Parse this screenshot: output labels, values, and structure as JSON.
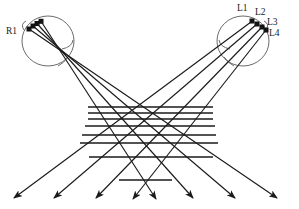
{
  "figure": {
    "type": "ray-diagram",
    "caption_labels": {
      "left_source": "R1",
      "right_sources": [
        "L1",
        "L2",
        "L3",
        "L4"
      ]
    },
    "colors": {
      "ray_stroke": "#1a1a1a",
      "head_outline": "#555555",
      "grid_line": "#1a1a1a",
      "background": "#ffffff",
      "marker_fill": "#111111"
    },
    "labels": [
      {
        "id": "R1",
        "text": "R1",
        "x": 6,
        "y": 28
      },
      {
        "id": "L1",
        "text": "L1",
        "x": 238,
        "y": 6
      },
      {
        "id": "L2",
        "text": "L2",
        "x": 256,
        "y": 9
      },
      {
        "id": "L3",
        "text": "L3",
        "x": 268,
        "y": 18
      },
      {
        "id": "L4",
        "text": "L4",
        "x": 270,
        "y": 29
      }
    ],
    "left_head": {
      "name": "left-head-outline",
      "cx": 48,
      "cy": 41,
      "rx": 26,
      "ry": 25,
      "focus_x": 62,
      "focus_y": 53
    },
    "right_head": {
      "name": "right-head-outline",
      "cx": 243,
      "cy": 41,
      "rx": 26,
      "ry": 25,
      "focus_x": 232,
      "focus_y": 53
    },
    "left_markers": [
      {
        "x": 29,
        "y": 29
      },
      {
        "x": 33,
        "y": 26
      },
      {
        "x": 37,
        "y": 23
      },
      {
        "x": 41,
        "y": 21
      }
    ],
    "right_markers": [
      {
        "x": 252,
        "y": 21
      },
      {
        "x": 257,
        "y": 24
      },
      {
        "x": 262,
        "y": 27
      },
      {
        "x": 266,
        "y": 30
      }
    ],
    "grid_lines": [
      {
        "y": 107,
        "x1": 88,
        "x2": 213
      },
      {
        "y": 113,
        "x1": 88,
        "x2": 213
      },
      {
        "y": 119,
        "x1": 88,
        "x2": 213
      },
      {
        "y": 126,
        "x1": 85,
        "x2": 215
      },
      {
        "y": 135,
        "x1": 82,
        "x2": 216
      },
      {
        "y": 143,
        "x1": 80,
        "x2": 218
      },
      {
        "y": 157,
        "x1": 89,
        "x2": 213
      },
      {
        "y": 180,
        "x1": 119,
        "x2": 172
      }
    ],
    "arrow_count": 8,
    "arrow_tips": [
      {
        "x": 14,
        "y": 198
      },
      {
        "x": 54,
        "y": 198
      },
      {
        "x": 96,
        "y": 198
      },
      {
        "x": 133,
        "y": 199
      },
      {
        "x": 156,
        "y": 199
      },
      {
        "x": 193,
        "y": 198
      },
      {
        "x": 235,
        "y": 198
      },
      {
        "x": 277,
        "y": 198
      }
    ]
  }
}
